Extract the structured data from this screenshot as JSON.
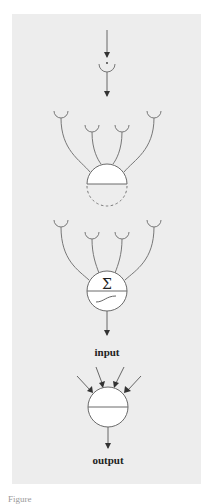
{
  "diagram": {
    "labels": {
      "sum_symbol": "Σ",
      "input": "input",
      "output": "output"
    },
    "caption": "Figure",
    "colors": {
      "panel": "#ededed",
      "stroke": "#6a6a6a",
      "arrow": "#333333",
      "node_fill": "#ffffff"
    }
  }
}
